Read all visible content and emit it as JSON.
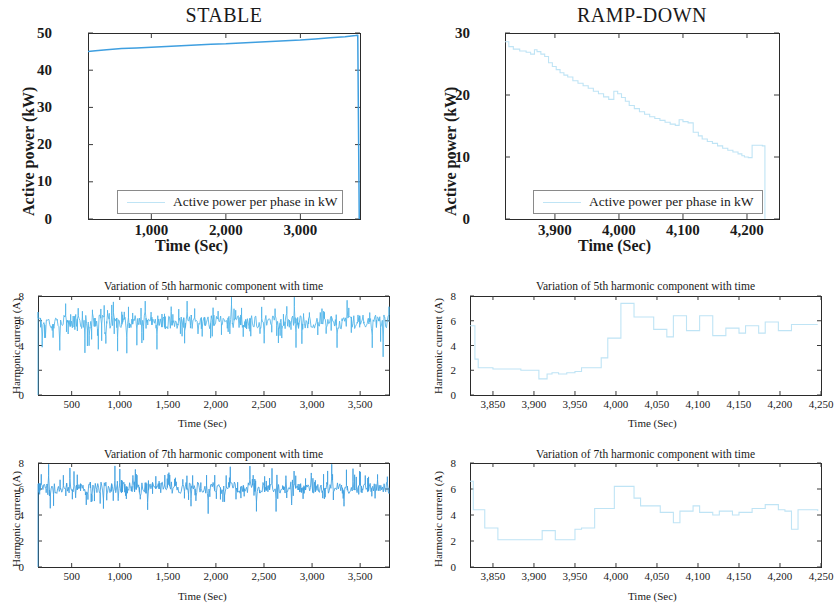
{
  "figure": {
    "background": "#ffffff",
    "series_color_stable": "#3f9fe0",
    "series_color_ramp": "#bfe4f5",
    "axis_color": "#2b2b2b"
  },
  "panels": {
    "top_left": {
      "title": "STABLE",
      "xlabel": "Time (Sec)",
      "ylabel": "Active power (kW)",
      "legend": "Active power per phase in kW",
      "yticks": [
        "0",
        "10",
        "20",
        "30",
        "40",
        "50"
      ],
      "xticks": [
        "1,000",
        "2,000",
        "3,000"
      ]
    },
    "top_right": {
      "title": "RAMP-DOWN",
      "xlabel": "Time (Sec)",
      "ylabel": "Active power (kW)",
      "legend": "Active power per phase in kW",
      "yticks": [
        "0",
        "10",
        "20",
        "30"
      ],
      "xticks": [
        "3,900",
        "4,000",
        "4,100",
        "4,200"
      ]
    },
    "mid_left": {
      "title": "Variation of 5th harmonic component with time",
      "xlabel": "Time (Sec)",
      "ylabel": "Harmonic current (A)",
      "yticks": [
        "0",
        "2",
        "4",
        "6",
        "8"
      ],
      "xticks": [
        "500",
        "1,000",
        "1,500",
        "2,000",
        "2,500",
        "3,000",
        "3,500"
      ]
    },
    "mid_right": {
      "title": "Variation of 5th harmonic component with time",
      "xlabel": "Time (Sec)",
      "ylabel": "Harmonic current (A)",
      "yticks": [
        "0",
        "2",
        "4",
        "6",
        "8"
      ],
      "xticks": [
        "3,850",
        "3,900",
        "3,950",
        "4,000",
        "4,050",
        "4,100",
        "4,150",
        "4,200",
        "4,250"
      ]
    },
    "bot_left": {
      "title": "Variation of 7th harmonic component with time",
      "xlabel": "Time (Sec)",
      "ylabel": "Harmonic current (A)",
      "yticks": [
        "0",
        "2",
        "4",
        "6",
        "8"
      ],
      "xticks": [
        "500",
        "1,000",
        "1,500",
        "2,000",
        "2,500",
        "3,000",
        "3,500"
      ]
    },
    "bot_right": {
      "title": "Variation of 7th harmonic component with time",
      "xlabel": "Time (Sec)",
      "ylabel": "Harmonic current (A)",
      "yticks": [
        "0",
        "2",
        "4",
        "6",
        "8"
      ],
      "xticks": [
        "3,850",
        "3,900",
        "3,950",
        "4,000",
        "4,050",
        "4,100",
        "4,150",
        "4,200",
        "4,250"
      ]
    }
  },
  "chart_data": [
    {
      "id": "top_left",
      "type": "line",
      "title": "STABLE",
      "xlabel": "Time (Sec)",
      "ylabel": "Active power (kW)",
      "xlim": [
        150,
        3800
      ],
      "ylim": [
        0,
        50
      ],
      "xticks": [
        1000,
        2000,
        3000
      ],
      "yticks": [
        0,
        10,
        20,
        30,
        40,
        50
      ],
      "grid": false,
      "legend": [
        "Active power per phase in kW"
      ],
      "legend_position": "lower-center",
      "series": [
        {
          "name": "Active power per phase in kW",
          "color": "#3f9fe0",
          "x": [
            150,
            250,
            400,
            600,
            800,
            1000,
            1200,
            1400,
            1600,
            1800,
            2000,
            2200,
            2400,
            2600,
            2800,
            3000,
            3200,
            3400,
            3600,
            3740,
            3770,
            3790
          ],
          "y": [
            45.0,
            45.2,
            45.5,
            45.8,
            46.0,
            46.2,
            46.4,
            46.6,
            46.8,
            47.0,
            47.1,
            47.3,
            47.5,
            47.7,
            47.9,
            48.1,
            48.4,
            48.7,
            49.0,
            49.3,
            49.4,
            0.0
          ]
        }
      ]
    },
    {
      "id": "top_right",
      "type": "line",
      "title": "RAMP-DOWN",
      "xlabel": "Time (Sec)",
      "ylabel": "Active power (kW)",
      "xlim": [
        3822,
        4250
      ],
      "ylim": [
        0,
        30
      ],
      "xticks": [
        3900,
        4000,
        4100,
        4200
      ],
      "yticks": [
        0,
        10,
        20,
        30
      ],
      "grid": false,
      "legend": [
        "Active power per phase in kW"
      ],
      "legend_position": "lower-center",
      "series": [
        {
          "name": "Active power per phase in kW",
          "color": "#bfe4f5",
          "x": [
            3822,
            3828,
            3835,
            3845,
            3855,
            3862,
            3868,
            3872,
            3878,
            3884,
            3890,
            3896,
            3902,
            3908,
            3914,
            3920,
            3928,
            3936,
            3944,
            3952,
            3960,
            3968,
            3976,
            3984,
            3992,
            3998,
            4004,
            4010,
            4016,
            4024,
            4032,
            4040,
            4048,
            4056,
            4064,
            4072,
            4080,
            4088,
            4094,
            4100,
            4108,
            4116,
            4124,
            4130,
            4138,
            4146,
            4154,
            4162,
            4170,
            4178,
            4186,
            4192,
            4196,
            4202,
            4208,
            4214,
            4220,
            4224,
            4228
          ],
          "y": [
            28.6,
            27.8,
            27.4,
            27.1,
            26.9,
            26.6,
            27.3,
            27.0,
            26.6,
            26.2,
            25.2,
            24.6,
            24.1,
            23.6,
            23.2,
            22.9,
            22.3,
            21.9,
            21.5,
            21.1,
            20.6,
            20.2,
            19.7,
            19.3,
            20.6,
            20.2,
            19.6,
            19.0,
            18.3,
            17.8,
            17.3,
            16.9,
            16.5,
            16.2,
            15.9,
            15.6,
            15.3,
            15.1,
            16.0,
            15.7,
            15.5,
            14.0,
            13.4,
            12.9,
            12.5,
            12.2,
            11.8,
            11.4,
            11.1,
            10.8,
            10.5,
            10.2,
            10.0,
            9.9,
            11.9,
            11.9,
            11.9,
            11.8,
            0.0
          ]
        }
      ]
    },
    {
      "id": "mid_left",
      "type": "line",
      "title": "Variation of 5th harmonic component with time",
      "xlabel": "Time (Sec)",
      "ylabel": "Harmonic current (A)",
      "xlim": [
        150,
        3800
      ],
      "ylim": [
        0,
        8
      ],
      "xticks": [
        500,
        1000,
        1500,
        2000,
        2500,
        3000,
        3500
      ],
      "yticks": [
        0,
        2,
        4,
        6,
        8
      ],
      "grid": false,
      "noise": {
        "mean": 5.9,
        "band": 0.75,
        "spike_up": 1.1,
        "spike_down": 1.3,
        "n": 420,
        "seed": 17
      },
      "series": [
        {
          "name": "5th harmonic current",
          "color": "#4fb3e8",
          "description": "Noisy band centred near 5.9 A, spread roughly 4.7-7.2 A across 150-3800 s"
        }
      ]
    },
    {
      "id": "mid_right",
      "type": "line",
      "title": "Variation of 5th harmonic component with time",
      "xlabel": "Time (Sec)",
      "ylabel": "Harmonic current (A)",
      "xlim": [
        3822,
        4250
      ],
      "ylim": [
        0,
        8
      ],
      "xticks": [
        3850,
        3900,
        3950,
        4000,
        4050,
        4100,
        4150,
        4200,
        4250
      ],
      "yticks": [
        0,
        2,
        4,
        6,
        8
      ],
      "grid": false,
      "series": [
        {
          "name": "5th harmonic current",
          "color": "#bfe4f5",
          "x": [
            3822,
            3828,
            3832,
            3840,
            3850,
            3862,
            3872,
            3884,
            3896,
            3906,
            3916,
            3922,
            3930,
            3940,
            3950,
            3958,
            3966,
            3974,
            3982,
            3990,
            3998,
            4006,
            4014,
            4022,
            4030,
            4038,
            4046,
            4054,
            4062,
            4070,
            4078,
            4086,
            4094,
            4102,
            4110,
            4118,
            4126,
            4134,
            4142,
            4150,
            4158,
            4166,
            4174,
            4182,
            4190,
            4198,
            4206,
            4214,
            4222,
            4230,
            4238,
            4246
          ],
          "y": [
            5.6,
            2.9,
            2.2,
            2.2,
            2.1,
            2.1,
            2.1,
            2.0,
            2.0,
            1.3,
            1.7,
            1.8,
            1.7,
            1.8,
            1.9,
            2.2,
            2.2,
            2.2,
            3.0,
            4.6,
            4.6,
            7.4,
            7.4,
            6.3,
            6.3,
            6.3,
            5.3,
            5.3,
            4.7,
            6.4,
            6.4,
            5.2,
            5.2,
            6.4,
            6.4,
            4.8,
            4.8,
            5.4,
            5.4,
            5.0,
            5.6,
            5.6,
            5.0,
            5.9,
            5.9,
            5.2,
            5.2,
            5.7,
            5.7,
            5.7,
            5.7,
            5.7
          ]
        }
      ]
    },
    {
      "id": "bot_left",
      "type": "line",
      "title": "Variation of 7th harmonic component with time",
      "xlabel": "Time (Sec)",
      "ylabel": "Harmonic current (A)",
      "xlim": [
        150,
        3800
      ],
      "ylim": [
        0,
        8
      ],
      "xticks": [
        500,
        1000,
        1500,
        2000,
        2500,
        3000,
        3500
      ],
      "yticks": [
        0,
        2,
        4,
        6,
        8
      ],
      "grid": false,
      "noise": {
        "mean": 6.1,
        "band": 0.6,
        "spike_up": 1.2,
        "spike_down": 1.0,
        "n": 430,
        "seed": 91
      },
      "series": [
        {
          "name": "7th harmonic current",
          "color": "#3f9fe0",
          "description": "Noisy band centred near 6.1 A, spread roughly 5.2-7.3 A across 150-3800 s"
        }
      ]
    },
    {
      "id": "bot_right",
      "type": "line",
      "title": "Variation of 7th harmonic component with time",
      "xlabel": "Time (Sec)",
      "ylabel": "Harmonic current (A)",
      "xlim": [
        3822,
        4250
      ],
      "ylim": [
        0,
        8
      ],
      "xticks": [
        3850,
        3900,
        3950,
        4000,
        4050,
        4100,
        4150,
        4200,
        4250
      ],
      "yticks": [
        0,
        2,
        4,
        6,
        8
      ],
      "grid": false,
      "series": [
        {
          "name": "7th harmonic current",
          "color": "#bfe4f5",
          "x": [
            3822,
            3826,
            3832,
            3840,
            3848,
            3856,
            3864,
            3872,
            3880,
            3890,
            3900,
            3910,
            3918,
            3926,
            3934,
            3942,
            3950,
            3958,
            3966,
            3974,
            3982,
            3990,
            3998,
            4006,
            4014,
            4022,
            4030,
            4038,
            4046,
            4054,
            4062,
            4070,
            4078,
            4086,
            4094,
            4102,
            4110,
            4118,
            4126,
            4134,
            4142,
            4150,
            4158,
            4166,
            4174,
            4182,
            4190,
            4198,
            4206,
            4214,
            4222,
            4230,
            4238,
            4246
          ],
          "y": [
            6.6,
            4.4,
            4.4,
            3.0,
            3.0,
            2.1,
            2.1,
            2.1,
            2.1,
            2.1,
            2.1,
            2.8,
            2.8,
            2.1,
            2.1,
            2.1,
            2.9,
            3.0,
            3.0,
            4.5,
            4.5,
            4.5,
            6.2,
            6.2,
            6.2,
            5.3,
            4.7,
            4.7,
            4.7,
            4.2,
            4.2,
            3.4,
            4.3,
            4.3,
            4.7,
            4.2,
            4.2,
            4.0,
            4.3,
            4.3,
            4.0,
            4.2,
            4.2,
            4.5,
            4.5,
            4.8,
            4.8,
            4.4,
            4.3,
            2.9,
            4.4,
            4.4,
            4.4,
            4.3
          ]
        }
      ]
    }
  ]
}
